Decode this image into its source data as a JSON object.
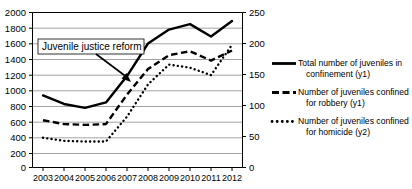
{
  "chart_data": {
    "type": "line",
    "title": "",
    "xlabel": "",
    "ylabel": "",
    "x": [
      2003,
      2004,
      2005,
      2006,
      2007,
      2008,
      2009,
      2010,
      2011,
      2012
    ],
    "categories": [
      "2003",
      "2004",
      "2005",
      "2006",
      "2007",
      "2008",
      "2009",
      "2010",
      "2011",
      "2012"
    ],
    "grid": true,
    "legend_position": "right",
    "axes": {
      "y1": {
        "label": "y1",
        "ticks": [
          0,
          200,
          400,
          600,
          800,
          1000,
          1200,
          1400,
          1600,
          1800,
          2000
        ],
        "tick_labels": [
          "0",
          "200",
          "400",
          "600",
          "800",
          "1000",
          "1200",
          "1400",
          "1600",
          "1800",
          "2000"
        ],
        "ylim": [
          0,
          2000
        ],
        "side": "left"
      },
      "y2": {
        "label": "y2",
        "ticks": [
          0,
          50,
          100,
          150,
          200,
          250
        ],
        "tick_labels": [
          "0",
          "50",
          "100",
          "150",
          "200",
          "250"
        ],
        "ylim": [
          0,
          250
        ],
        "side": "right"
      },
      "x": {
        "ticks": [
          2003,
          2004,
          2005,
          2006,
          2007,
          2008,
          2009,
          2010,
          2011,
          2012
        ],
        "xlim": [
          2003,
          2012
        ]
      }
    },
    "series": [
      {
        "name": "Total number of juveniles in confinement (y1)",
        "axis": "y1",
        "style": "solid",
        "values": [
          930,
          820,
          770,
          840,
          1180,
          1600,
          1780,
          1850,
          1690,
          1890
        ]
      },
      {
        "name": "Number of juveniles confined for robbery (y1)",
        "axis": "y1",
        "style": "dashed",
        "values": [
          610,
          560,
          550,
          560,
          940,
          1270,
          1450,
          1500,
          1380,
          1510
        ]
      },
      {
        "name": "Number of juveniles confined for homicide (y2)",
        "axis": "y2",
        "style": "dotted",
        "values": [
          48,
          43,
          42,
          42,
          82,
          134,
          166,
          161,
          149,
          198
        ]
      }
    ],
    "annotations": [
      {
        "text": "Juvenile justice reform",
        "points_to_year": 2007,
        "points_to_value": 1150
      }
    ],
    "colors": {
      "series_line": "#000000",
      "grid": "#808080",
      "axis": "#000000",
      "background": "#ffffff"
    }
  },
  "legend": {
    "entries": [
      {
        "line1": "Total number of juveniles in",
        "line2": "confinement (y1)",
        "marker": "solid-line-marker"
      },
      {
        "line1": "Number of juveniles confined",
        "line2": "for robbery (y1)",
        "marker": "dashed-line-marker"
      },
      {
        "line1": "Number of juveniles confined",
        "line2": "for homicide (y2)",
        "marker": "dotted-line-marker"
      }
    ]
  },
  "annotation": {
    "text": "Juvenile justice reform"
  },
  "y1_ticks": [
    "2000",
    "1800",
    "1600",
    "1400",
    "1200",
    "1000",
    "800",
    "600",
    "400",
    "200",
    "0"
  ],
  "y2_ticks": [
    "250",
    "200",
    "150",
    "100",
    "50",
    "0"
  ],
  "x_ticks": [
    "2003",
    "2004",
    "2005",
    "2006",
    "2007",
    "2008",
    "2009",
    "2010",
    "2011",
    "2012"
  ]
}
